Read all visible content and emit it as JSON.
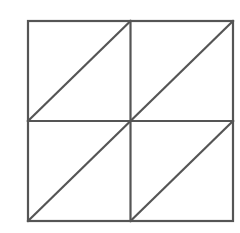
{
  "diagram": {
    "rows": 2,
    "cols": 2,
    "bounds": {
      "x0": 28,
      "y0": 21,
      "x1": 233,
      "y1": 221
    },
    "diagonal_direction": "bottom-left-to-top-right",
    "stroke_color": "#555555",
    "stroke_width": 2.2,
    "background_color": "#ffffff"
  }
}
